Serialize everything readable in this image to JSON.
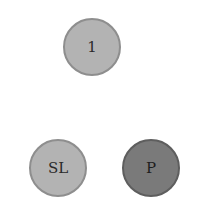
{
  "diagram": {
    "nodes": [
      {
        "id": "top",
        "label": "1",
        "shade": "light",
        "fill": "#b3b3b3"
      },
      {
        "id": "bottom-left",
        "label": "SL",
        "shade": "light",
        "fill": "#b3b3b3"
      },
      {
        "id": "bottom-right",
        "label": "P",
        "shade": "dark",
        "fill": "#7a7a7a"
      }
    ]
  }
}
